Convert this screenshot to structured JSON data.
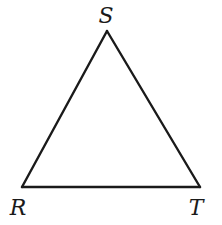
{
  "diagram": {
    "type": "geometric-figure",
    "shape": "triangle",
    "name": "triangle RST",
    "stroke_color": "#1a1a1a",
    "background_color": "#ffffff",
    "vertices": [
      {
        "id": "S",
        "label": "S",
        "x": 107,
        "y": 31,
        "label_x": 106,
        "label_y": 23
      },
      {
        "id": "R",
        "label": "R",
        "x": 22,
        "y": 187,
        "label_x": 18,
        "label_y": 215
      },
      {
        "id": "T",
        "label": "T",
        "x": 200,
        "y": 187,
        "label_x": 196,
        "label_y": 215
      }
    ],
    "edges": [
      {
        "id": "RS",
        "from": "R",
        "to": "S"
      },
      {
        "id": "ST",
        "from": "S",
        "to": "T"
      },
      {
        "id": "RT",
        "from": "R",
        "to": "T"
      }
    ]
  }
}
